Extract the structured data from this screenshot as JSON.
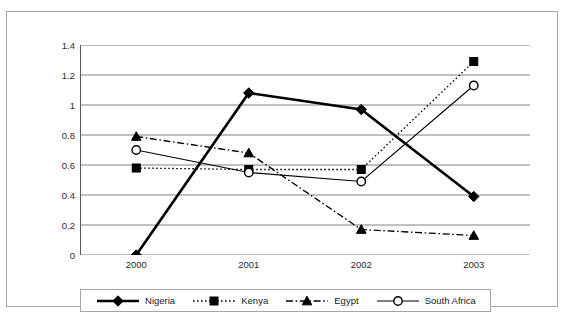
{
  "chart_data": {
    "type": "line",
    "title": "",
    "xlabel": "",
    "ylabel": "",
    "categories": [
      "2000",
      "2001",
      "2002",
      "2003"
    ],
    "ylim": [
      0,
      1.4
    ],
    "ytick_labels": [
      "0",
      "0.2",
      "0.4",
      "0.6",
      "0.8",
      "1",
      "1.2",
      "1.4"
    ],
    "ytick_values": [
      0,
      0.2,
      0.4,
      0.6,
      0.8,
      1,
      1.2,
      1.4
    ],
    "grid": "horizontal",
    "legend_position": "bottom",
    "series": [
      {
        "name": "Nigeria",
        "values": [
          0,
          1.08,
          0.97,
          0.39
        ],
        "marker": "filled-diamond",
        "line_style": "solid",
        "line_width": 2.6,
        "color": "#000000"
      },
      {
        "name": "Kenya",
        "values": [
          0.58,
          0.57,
          0.57,
          1.29
        ],
        "marker": "filled-square",
        "line_style": "dotted",
        "line_width": 1.3,
        "color": "#000000"
      },
      {
        "name": "Egypt",
        "values": [
          0.79,
          0.68,
          0.17,
          0.13
        ],
        "marker": "filled-triangle",
        "line_style": "dash-dot",
        "line_width": 1.3,
        "color": "#000000"
      },
      {
        "name": "South Africa",
        "values": [
          0.7,
          0.55,
          0.49,
          1.13
        ],
        "marker": "open-circle",
        "line_style": "solid",
        "line_width": 1.1,
        "color": "#000000"
      }
    ]
  },
  "legend": {
    "entries": [
      {
        "label": "Nigeria"
      },
      {
        "label": "Kenya"
      },
      {
        "label": "Egypt"
      },
      {
        "label": "South Africa"
      }
    ]
  },
  "colors": {
    "frame": "#a6a6a6",
    "gridline": "#808080",
    "axis": "#595959",
    "text": "#1a1a1a",
    "plot_background": "#ffffff"
  }
}
